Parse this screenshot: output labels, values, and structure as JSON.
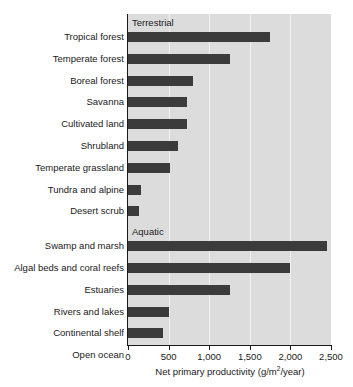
{
  "chart_data": {
    "type": "bar",
    "orientation": "horizontal",
    "title": "",
    "xlabel": "Net primary productivity (g/m2/year)",
    "ylabel": "",
    "xlim": [
      0,
      2500
    ],
    "xticks": [
      0,
      500,
      1000,
      1500,
      2000,
      2500
    ],
    "xtick_labels": [
      "0",
      "500",
      "1,000",
      "1,500",
      "2,000",
      "2,500"
    ],
    "grid": "vertical",
    "legend": "none",
    "bar_color": "#3b3b3b",
    "plot_background": "#dcdcdc",
    "groups": [
      {
        "name": "Terrestrial",
        "categories": [
          "Tropical forest",
          "Temperate forest",
          "Boreal forest",
          "Savanna",
          "Cultivated land",
          "Shrubland",
          "Temperate grassland",
          "Tundra and alpine",
          "Desert scrub"
        ],
        "values": [
          1750,
          1250,
          800,
          730,
          730,
          620,
          520,
          160,
          135
        ]
      },
      {
        "name": "Aquatic",
        "categories": [
          "Swamp and marsh",
          "Algal beds and coral reefs",
          "Estuaries",
          "Rivers and lakes",
          "Continental shelf",
          "Open ocean"
        ],
        "values": [
          2450,
          2000,
          1250,
          510,
          430,
          125
        ]
      }
    ],
    "categories": [
      "Tropical forest",
      "Temperate forest",
      "Boreal forest",
      "Savanna",
      "Cultivated land",
      "Shrubland",
      "Temperate grassland",
      "Tundra and alpine",
      "Desert scrub",
      "Swamp and marsh",
      "Algal beds and coral reefs",
      "Estuaries",
      "Rivers and lakes",
      "Continental shelf",
      "Open ocean"
    ],
    "values": [
      1750,
      1250,
      800,
      730,
      730,
      620,
      520,
      160,
      135,
      2450,
      2000,
      1250,
      510,
      430,
      125
    ]
  },
  "axis": {
    "x_title_main": "Net primary productivity (g/m",
    "x_title_sup": "2",
    "x_title_tail": "/year)"
  },
  "sections": {
    "terrestrial_label": "Terrestrial",
    "aquatic_label": "Aquatic"
  }
}
